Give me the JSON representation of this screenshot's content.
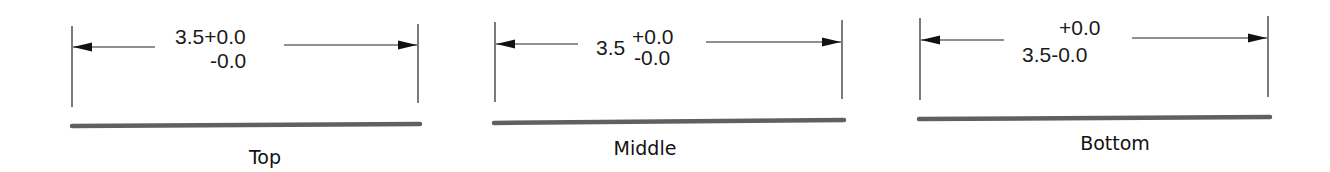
{
  "figure": {
    "colors": {
      "lines": "#222222",
      "bar": "#606060",
      "text": "#1a1a1a",
      "background": "#ffffff"
    }
  },
  "panels": [
    {
      "label": "Top",
      "nominal": "3.5",
      "upper_tol": "+0.0",
      "lower_tol": "-0.0",
      "line1": "3.5+0.0",
      "line2": "-0.0"
    },
    {
      "label": "Middle",
      "nominal": "3.5",
      "upper_tol": "+0.0",
      "lower_tol": "-0.0"
    },
    {
      "label": "Bottom",
      "nominal": "3.5",
      "upper_tol": "+0.0",
      "lower_tol": "-0.0",
      "line1": "+0.0",
      "line2": "3.5-0.0"
    }
  ]
}
